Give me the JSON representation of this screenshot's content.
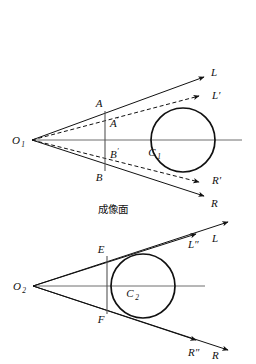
{
  "figure": {
    "width": 256,
    "height": 364,
    "background": "#ffffff",
    "stroke_color": "#111111",
    "axis_color": "#6f6f6f",
    "caption": "成像面"
  },
  "upper_diagram": {
    "name": "upper-optical-diagram",
    "vertex": {
      "label": "O",
      "subscript": "1",
      "x": 32,
      "y": 140
    },
    "circle": {
      "label": "C",
      "subscript": "1",
      "cx": 183,
      "cy": 140,
      "r": 32
    },
    "image_plane": {
      "x": 105,
      "y_top": 111,
      "y_bottom": 171
    },
    "points": [
      {
        "label": "A",
        "prime": "",
        "x": 105,
        "y": 111
      },
      {
        "label": "A",
        "prime": "′",
        "x": 105,
        "y": 124
      },
      {
        "label": "B",
        "prime": "′",
        "x": 105,
        "y": 156
      },
      {
        "label": "B",
        "prime": "",
        "x": 105,
        "y": 171
      }
    ],
    "rays": [
      {
        "label": "L",
        "style": "solid",
        "tip_x": 204,
        "tip_y": 77,
        "label_x": 211,
        "label_y": 72
      },
      {
        "label": "L′",
        "style": "dashed",
        "tip_x": 201,
        "tip_y": 96,
        "label_x": 213,
        "label_y": 95
      },
      {
        "label": "R′",
        "style": "dashed",
        "tip_x": 201,
        "tip_y": 182,
        "label_x": 213,
        "label_y": 180
      },
      {
        "label": "R",
        "style": "solid",
        "tip_x": 204,
        "tip_y": 196,
        "label_x": 211,
        "label_y": 204
      }
    ],
    "axis": {
      "x1": 32,
      "y1": 140,
      "x2": 242,
      "y2": 140
    }
  },
  "lower_diagram": {
    "name": "lower-optical-diagram",
    "vertex": {
      "label": "O",
      "subscript": "2",
      "x": 33,
      "y": 286
    },
    "circle": {
      "label": "C",
      "subscript": "2",
      "cx": 143,
      "cy": 286,
      "r": 32
    },
    "image_plane": {
      "x": 107,
      "y_top": 256,
      "y_bottom": 314
    },
    "points": [
      {
        "label": "E",
        "x": 107,
        "y": 256
      },
      {
        "label": "F",
        "x": 107,
        "y": 314
      }
    ],
    "rays": [
      {
        "label": "L″",
        "style": "solid",
        "tip_x": 196,
        "tip_y": 234,
        "label_x": 194,
        "label_y": 245
      },
      {
        "label": "L",
        "style": "solid",
        "tip_x": 226,
        "tip_y": 224,
        "label_x": 216,
        "label_y": 239
      },
      {
        "label": "R″",
        "style": "solid",
        "tip_x": 196,
        "tip_y": 340,
        "label_x": 194,
        "label_y": 353
      },
      {
        "label": "R",
        "style": "solid",
        "tip_x": 226,
        "tip_y": 350,
        "label_x": 216,
        "label_y": 356
      }
    ],
    "axis": {
      "x1": 33,
      "y1": 286,
      "x2": 205,
      "y2": 286
    }
  }
}
